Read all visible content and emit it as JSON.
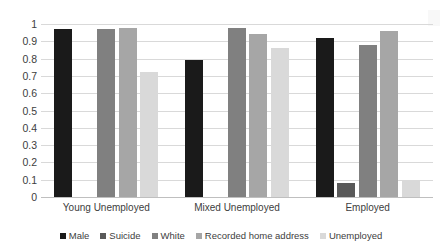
{
  "chart_data": {
    "type": "bar",
    "title": "",
    "subtitle": "",
    "xlabel": "",
    "ylabel": "",
    "ylim": [
      0,
      1
    ],
    "yticks": [
      0,
      0.1,
      0.2,
      0.3,
      0.4,
      0.5,
      0.6,
      0.7,
      0.8,
      0.9,
      1
    ],
    "ytick_labels": [
      "0",
      "0.1",
      "0.2",
      "0.3",
      "0.4",
      "0.5",
      "0.6",
      "0.7",
      "0.8",
      "0.9",
      "1"
    ],
    "grid": true,
    "legend_position": "bottom",
    "categories": [
      "Young Unemployed",
      "Mixed Unemployed",
      "Employed"
    ],
    "series": [
      {
        "name": "Male",
        "color": "#1a1a1a",
        "values": [
          0.97,
          0,
          0.92
        ]
      },
      {
        "name": "Suicide",
        "color": "#595959",
        "values": [
          0,
          0,
          0.08
        ]
      },
      {
        "name": "White",
        "color": "#808080",
        "values": [
          0.97,
          0.975,
          0.88
        ]
      },
      {
        "name": "Recorded home address",
        "color": "#a6a6a6",
        "values": [
          0.975,
          0.94,
          0.96
        ]
      },
      {
        "name": "Unemployed",
        "color": "#d9d9d9",
        "values": [
          0.72,
          0.86,
          0.1
        ]
      }
    ],
    "group2_male_note": 0.79
  },
  "axis": {
    "y_ticks": [
      "1",
      "0.9",
      "0.8",
      "0.7",
      "0.6",
      "0.5",
      "0.4",
      "0.3",
      "0.2",
      "0.1",
      "0"
    ],
    "x_categories": [
      "Young Unemployed",
      "Mixed Unemployed",
      "Employed"
    ]
  },
  "legend": {
    "items": [
      {
        "label": "Male",
        "color": "#1a1a1a"
      },
      {
        "label": "Suicide",
        "color": "#595959"
      },
      {
        "label": "White",
        "color": "#808080"
      },
      {
        "label": "Recorded home address",
        "color": "#a6a6a6"
      },
      {
        "label": "Unemployed",
        "color": "#d9d9d9"
      }
    ]
  },
  "colors": {
    "gridline": "#d9d9d9",
    "baseline": "#bfbfbf",
    "text": "#404040",
    "background": "#ffffff"
  }
}
